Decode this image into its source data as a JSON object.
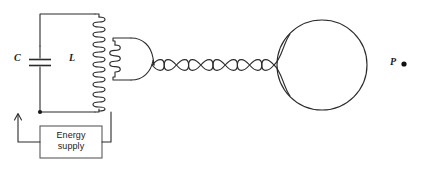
{
  "figure": {
    "kind": "physics-circuit-diagram",
    "background_color": "#ffffff",
    "line_color": "#2b2b2b",
    "width": 424,
    "height": 169
  },
  "labels": {
    "capacitor": "C",
    "inductor": "L",
    "point": "P",
    "energy_supply_line1": "Energy",
    "energy_supply_line2": "supply"
  },
  "components": {
    "capacitor": {
      "name": "capacitor",
      "symbol": "C",
      "plate_count": 2,
      "x": 40,
      "y": 62
    },
    "primary_coil": {
      "name": "primary-inductor",
      "symbol": "L",
      "turns": 19,
      "x": 96,
      "y_top": 17,
      "y_bottom": 112
    },
    "secondary_coil": {
      "name": "secondary-coil",
      "turns": 5,
      "x": 117,
      "y_top": 45,
      "y_bottom": 72
    },
    "energy_supply": {
      "name": "energy-supply",
      "x": 40,
      "y": 126,
      "width": 62,
      "height": 32
    },
    "twisted_pair": {
      "name": "twisted-pair-line",
      "crossings": 10,
      "x_start": 152,
      "x_end": 275,
      "y": 65
    },
    "sphere": {
      "name": "conducting-sphere",
      "cx": 322,
      "cy": 65,
      "r": 45
    },
    "point_p": {
      "name": "point-p",
      "x": 404,
      "y": 64
    },
    "current_arrow": {
      "name": "current-direction-arrow",
      "x": 18,
      "y": 112,
      "direction": "up"
    },
    "junction_dot": {
      "name": "junction-node",
      "x": 40,
      "y": 112
    }
  }
}
